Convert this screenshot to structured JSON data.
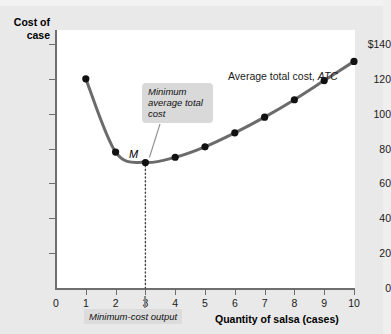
{
  "figure": {
    "y_axis_title": "Cost of case",
    "x_axis_title": "Quantity of salsa (cases)",
    "series_label_text": "Average total cost, ",
    "series_label_symbol": "ATC",
    "callout_text": "Minimum average total cost",
    "min_output_label": "Minimum-cost output",
    "point_label": "M"
  },
  "chart_data": {
    "type": "line",
    "title": "",
    "xlabel": "Quantity of salsa (cases)",
    "ylabel": "Cost of case",
    "xlim": [
      0,
      10.6
    ],
    "ylim": [
      0,
      148
    ],
    "grid": false,
    "legend_position": "upper-right-inside",
    "x_ticks": [
      0,
      1,
      2,
      3,
      4,
      5,
      6,
      7,
      8,
      9,
      10
    ],
    "x_tick_labels": [
      "0",
      "1",
      "2",
      "3",
      "4",
      "5",
      "6",
      "7",
      "8",
      "9",
      "10"
    ],
    "y_ticks": [
      0,
      20,
      40,
      60,
      80,
      100,
      120,
      140
    ],
    "y_tick_labels": [
      "0",
      "20",
      "40",
      "60",
      "80",
      "100",
      "120",
      "$140"
    ],
    "series": [
      {
        "name": "Average total cost, ATC",
        "x": [
          1,
          2,
          3,
          4,
          5,
          6,
          7,
          8,
          9,
          10
        ],
        "values": [
          120,
          78,
          72,
          75,
          81,
          89,
          98,
          108,
          119,
          130
        ],
        "color": "#6b6b6b",
        "marker": "circle",
        "marker_color": "#111111"
      }
    ],
    "annotations": [
      {
        "name": "minimum-point-label",
        "text": "M",
        "x": 3,
        "y": 72
      },
      {
        "name": "callout",
        "text": "Minimum average total cost",
        "points_to_x": 3,
        "points_to_y": 72
      },
      {
        "name": "minimum-cost-output",
        "text": "Minimum-cost output",
        "x": 3,
        "y": 0
      },
      {
        "name": "dropline",
        "style": "dotted",
        "from_x": 3,
        "from_y": 72,
        "to_x": 3,
        "to_y": 0
      }
    ]
  }
}
